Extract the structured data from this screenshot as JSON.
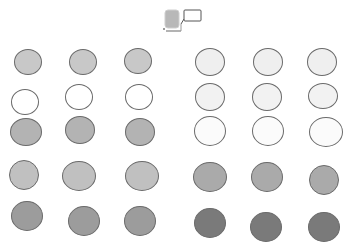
{
  "header_icon": {
    "name": "node-with-callout-icon",
    "fill": "#b8b8b8",
    "callout_stroke": "#555555"
  },
  "border_color": "#6a6a6a",
  "groups": [
    {
      "name": "left-group",
      "rows": [
        {
          "fill": "#c8c8c8",
          "dots": [
            {
              "cx": 28,
              "cy": 62,
              "rx": 14,
              "ry": 13
            },
            {
              "cx": 83,
              "cy": 62,
              "rx": 14,
              "ry": 13
            },
            {
              "cx": 138,
              "cy": 61,
              "rx": 14,
              "ry": 13
            }
          ]
        },
        {
          "fill": "#ffffff",
          "dots": [
            {
              "cx": 25,
              "cy": 102,
              "rx": 14,
              "ry": 13
            },
            {
              "cx": 79,
              "cy": 97,
              "rx": 14,
              "ry": 13
            },
            {
              "cx": 139,
              "cy": 97,
              "rx": 14,
              "ry": 13
            }
          ]
        },
        {
          "fill": "#b3b3b3",
          "dots": [
            {
              "cx": 26,
              "cy": 132,
              "rx": 16,
              "ry": 14
            },
            {
              "cx": 80,
              "cy": 130,
              "rx": 15,
              "ry": 14
            },
            {
              "cx": 140,
              "cy": 132,
              "rx": 15,
              "ry": 14
            }
          ]
        },
        {
          "fill": "#c0c0c0",
          "dots": [
            {
              "cx": 24,
              "cy": 175,
              "rx": 15,
              "ry": 15
            },
            {
              "cx": 79,
              "cy": 176,
              "rx": 17,
              "ry": 15
            },
            {
              "cx": 142,
              "cy": 176,
              "rx": 17,
              "ry": 15
            }
          ]
        },
        {
          "fill": "#9c9c9c",
          "dots": [
            {
              "cx": 27,
              "cy": 216,
              "rx": 16,
              "ry": 15
            },
            {
              "cx": 84,
              "cy": 221,
              "rx": 16,
              "ry": 15
            },
            {
              "cx": 140,
              "cy": 221,
              "rx": 16,
              "ry": 15
            }
          ]
        }
      ]
    },
    {
      "name": "right-group",
      "rows": [
        {
          "fill": "#efefef",
          "dots": [
            {
              "cx": 210,
              "cy": 62,
              "rx": 15,
              "ry": 14
            },
            {
              "cx": 268,
              "cy": 62,
              "rx": 15,
              "ry": 14
            },
            {
              "cx": 322,
              "cy": 62,
              "rx": 15,
              "ry": 14
            }
          ]
        },
        {
          "fill": "#f2f2f2",
          "dots": [
            {
              "cx": 210,
              "cy": 97,
              "rx": 15,
              "ry": 14
            },
            {
              "cx": 267,
              "cy": 97,
              "rx": 15,
              "ry": 14
            },
            {
              "cx": 323,
              "cy": 96,
              "rx": 15,
              "ry": 13
            }
          ]
        },
        {
          "fill": "#fbfbfb",
          "dots": [
            {
              "cx": 210,
              "cy": 131,
              "rx": 16,
              "ry": 15
            },
            {
              "cx": 268,
              "cy": 131,
              "rx": 16,
              "ry": 15
            },
            {
              "cx": 326,
              "cy": 132,
              "rx": 17,
              "ry": 15
            }
          ]
        },
        {
          "fill": "#aaaaaa",
          "dots": [
            {
              "cx": 210,
              "cy": 177,
              "rx": 17,
              "ry": 15
            },
            {
              "cx": 267,
              "cy": 177,
              "rx": 16,
              "ry": 15
            },
            {
              "cx": 324,
              "cy": 180,
              "rx": 15,
              "ry": 15
            }
          ]
        },
        {
          "fill": "#7a7a7a",
          "dots": [
            {
              "cx": 210,
              "cy": 223,
              "rx": 16,
              "ry": 15
            },
            {
              "cx": 266,
              "cy": 227,
              "rx": 16,
              "ry": 15
            },
            {
              "cx": 324,
              "cy": 227,
              "rx": 16,
              "ry": 15
            }
          ]
        }
      ]
    }
  ]
}
